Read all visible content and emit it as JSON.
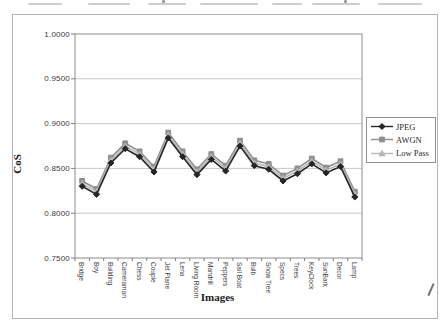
{
  "chart": {
    "y_axis_title": "CoS",
    "x_axis_title": "Images",
    "y_tick_labels": [
      "1.0000",
      "0.9500",
      "0.9000",
      "0.8500",
      "0.8000",
      "0.7500"
    ]
  },
  "chart_data": {
    "type": "line",
    "title": "",
    "xlabel": "Images",
    "ylabel": "CoS",
    "ylim": [
      0.75,
      1.0
    ],
    "y_ticks": [
      1.0,
      0.95,
      0.9,
      0.85,
      0.8,
      0.75
    ],
    "grid": true,
    "legend_position": "right",
    "categories": [
      "Bridge",
      "Boy",
      "Building",
      "Cameraman",
      "Chess",
      "Couple",
      "Jet Plane",
      "Lena",
      "Living Room",
      "Mandrill",
      "Peppers",
      "Sail Boat",
      "Bulb",
      "Snow Tree",
      "Specs",
      "Trees",
      "KeyClock",
      "SunBark",
      "Decor",
      "Lamp"
    ],
    "series": [
      {
        "name": "JPEG",
        "marker": "diamond",
        "color": "#262626",
        "values": [
          0.83,
          0.821,
          0.856,
          0.872,
          0.863,
          0.846,
          0.884,
          0.863,
          0.843,
          0.86,
          0.847,
          0.875,
          0.853,
          0.849,
          0.836,
          0.844,
          0.855,
          0.845,
          0.852,
          0.818
        ]
      },
      {
        "name": "AWGN",
        "marker": "square",
        "color": "#8f8f8f",
        "values": [
          0.836,
          0.827,
          0.862,
          0.878,
          0.869,
          0.852,
          0.89,
          0.869,
          0.849,
          0.866,
          0.853,
          0.881,
          0.859,
          0.855,
          0.842,
          0.85,
          0.861,
          0.851,
          0.858,
          0.824
        ]
      },
      {
        "name": "Low Pass",
        "marker": "triangle",
        "color": "#b7b7b7",
        "values": [
          0.833,
          0.824,
          0.859,
          0.875,
          0.866,
          0.849,
          0.887,
          0.866,
          0.846,
          0.863,
          0.85,
          0.878,
          0.856,
          0.852,
          0.839,
          0.847,
          0.858,
          0.848,
          0.855,
          0.821
        ]
      }
    ]
  },
  "colors": {
    "grid": "#c9c9c9",
    "plot_border": "#8c8c8c",
    "tick": "#808080"
  }
}
